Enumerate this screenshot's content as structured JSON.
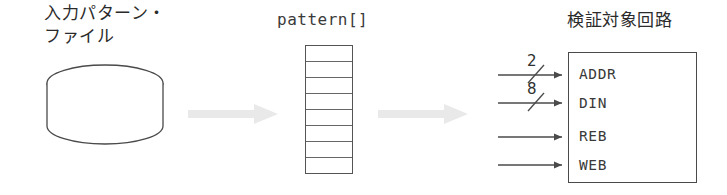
{
  "diagram": {
    "title_left": "入力パターン・\nファイル",
    "title_middle": "pattern[]",
    "title_right": "検証対象回路",
    "source_icon": "database-cylinder-icon",
    "flow_arrow_icon": "gray-block-arrow-icon",
    "array": {
      "cell_count": 8,
      "cells": [
        "",
        "",
        "",
        "",
        "",
        "",
        "",
        ""
      ]
    },
    "dut": {
      "ports": [
        {
          "name": "ADDR",
          "bus_width": "2",
          "has_slash": true
        },
        {
          "name": "DIN",
          "bus_width": "8",
          "has_slash": true
        },
        {
          "name": "REB",
          "bus_width": "",
          "has_slash": false
        },
        {
          "name": "WEB",
          "bus_width": "",
          "has_slash": false
        }
      ]
    },
    "colors": {
      "line": "#4a4a4a",
      "text": "#2b2b2b",
      "gray_arrow": "#e9e9e9",
      "background": "#ffffff"
    }
  }
}
